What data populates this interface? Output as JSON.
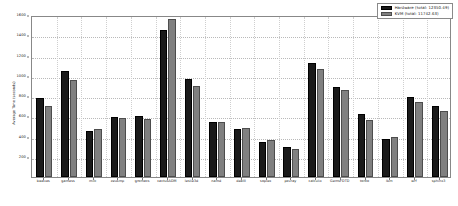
{
  "chart_data": {
    "type": "bar",
    "title": "",
    "xlabel": "",
    "ylabel": "Average Time (seconds)",
    "ylim": [
      0,
      1600
    ],
    "yticks": [
      200,
      400,
      600,
      800,
      1000,
      1200,
      1400,
      1600
    ],
    "ytick_labels": [
      "200",
      "400",
      "600",
      "800",
      "1000",
      "1200",
      "1400",
      "1600"
    ],
    "grid": true,
    "legend_position": "upper right",
    "categories": [
      "bwaves",
      "gamess",
      "milc",
      "zeusmp",
      "gromacs",
      "cactusADM",
      "leslie3d",
      "namd",
      "dealII",
      "soplex",
      "povray",
      "calculix",
      "GemsFDTD",
      "tonto",
      "lbm",
      "wrf",
      "sphinx3"
    ],
    "series": [
      {
        "name": "Hardware",
        "color": "#1a1a1a",
        "total": 12350.49,
        "legend_label": "Hardware (total: 12350.49)",
        "values": [
          780,
          1050,
          455,
          595,
          600,
          1455,
          965,
          545,
          475,
          350,
          295,
          1130,
          890,
          620,
          380,
          790,
          700
        ]
      },
      {
        "name": "KVM",
        "color": "#808080",
        "total": 11742.63,
        "legend_label": "KVM (total: 11742.63)",
        "values": [
          700,
          960,
          470,
          585,
          575,
          1565,
          900,
          540,
          485,
          370,
          275,
          1070,
          860,
          565,
          400,
          740,
          650
        ]
      }
    ]
  }
}
